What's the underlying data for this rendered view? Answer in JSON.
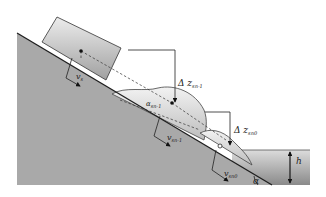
{
  "diagram": {
    "type": "landslide-generated wave schematic",
    "colors": {
      "slope": "#a9a9a9",
      "slope_line": "#1e1e1e",
      "block_top": "#e4e4e4",
      "block_bottom": "#9a9a9a",
      "water_top": "#d8d8d8",
      "water_bottom": "#8e8e8e",
      "deposit": "#cfcfcf"
    },
    "labels": {
      "v_s": "v",
      "v_s_sub": "s",
      "v_n1": "v",
      "v_n1_sub": "sn-1",
      "v_n0": "v",
      "v_n0_sub": "sn0",
      "dz_n1": "Δ z",
      "dz_n1_sub": "sn-1",
      "dz_n0": "Δ z",
      "dz_n0_sub": "sn0",
      "alpha": "α",
      "alpha_small": "α",
      "alpha_small_sub": "sn-1",
      "h": "h"
    }
  }
}
